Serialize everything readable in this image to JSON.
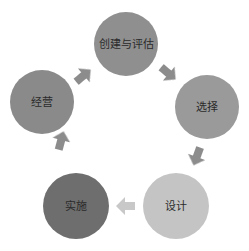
{
  "diagram": {
    "type": "cycle",
    "nodes": [
      {
        "id": "create",
        "label": "创建与评估",
        "cx": 126,
        "cy": 44,
        "r": 32,
        "color": "#8f8f8f"
      },
      {
        "id": "select",
        "label": "选择",
        "cx": 207,
        "cy": 107,
        "r": 32,
        "color": "#9a9a9a"
      },
      {
        "id": "design",
        "label": "设计",
        "cx": 176,
        "cy": 206,
        "r": 33,
        "color": "#c4c4c4"
      },
      {
        "id": "implement",
        "label": "实施",
        "cx": 76,
        "cy": 206,
        "r": 33,
        "color": "#6e6e6e"
      },
      {
        "id": "operate",
        "label": "经营",
        "cx": 42,
        "cy": 102,
        "r": 32,
        "color": "#8a8a8a"
      }
    ],
    "edges": [
      {
        "from": "operate",
        "to": "create",
        "x": 83,
        "y": 76,
        "angle": -40,
        "color": "#8c8c8c"
      },
      {
        "from": "create",
        "to": "select",
        "x": 168,
        "y": 73,
        "angle": 40,
        "color": "#8c8c8c"
      },
      {
        "from": "select",
        "to": "design",
        "x": 197,
        "y": 156,
        "angle": 110,
        "color": "#8c8c8c"
      },
      {
        "from": "design",
        "to": "implement",
        "x": 126,
        "y": 206,
        "angle": 180,
        "color": "#c8c8c8"
      },
      {
        "from": "implement",
        "to": "operate",
        "x": 61,
        "y": 141,
        "angle": -75,
        "color": "#8c8c8c"
      }
    ]
  }
}
